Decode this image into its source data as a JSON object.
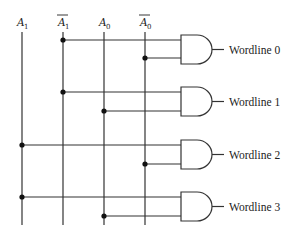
{
  "inputs": [
    {
      "name": "A",
      "sub": "1",
      "complement": false,
      "x": 22
    },
    {
      "name": "A",
      "sub": "1",
      "complement": true,
      "x": 63
    },
    {
      "name": "A",
      "sub": "0",
      "complement": false,
      "x": 104
    },
    {
      "name": "A",
      "sub": "0",
      "complement": true,
      "x": 145
    }
  ],
  "gates": [
    {
      "label": "Wordline 0",
      "top": 35,
      "in1": {
        "y": 40,
        "src": 1
      },
      "in2": {
        "y": 58,
        "src": 3
      }
    },
    {
      "label": "Wordline 1",
      "top": 87,
      "in1": {
        "y": 92,
        "src": 1
      },
      "in2": {
        "y": 111,
        "src": 2
      }
    },
    {
      "label": "Wordline 2",
      "top": 140,
      "in1": {
        "y": 145,
        "src": 0
      },
      "in2": {
        "y": 164,
        "src": 3
      }
    },
    {
      "label": "Wordline 3",
      "top": 192,
      "in1": {
        "y": 197,
        "src": 0
      },
      "in2": {
        "y": 216,
        "src": 2
      }
    }
  ],
  "labels": {
    "a1": "A",
    "a1_sub": "1",
    "a1bar": "A",
    "a1bar_sub": "1",
    "a0": "A",
    "a0_sub": "0",
    "a0bar": "A",
    "a0bar_sub": "0",
    "wl0": "Wordline 0",
    "wl1": "Wordline 1",
    "wl2": "Wordline 2",
    "wl3": "Wordline 3"
  }
}
